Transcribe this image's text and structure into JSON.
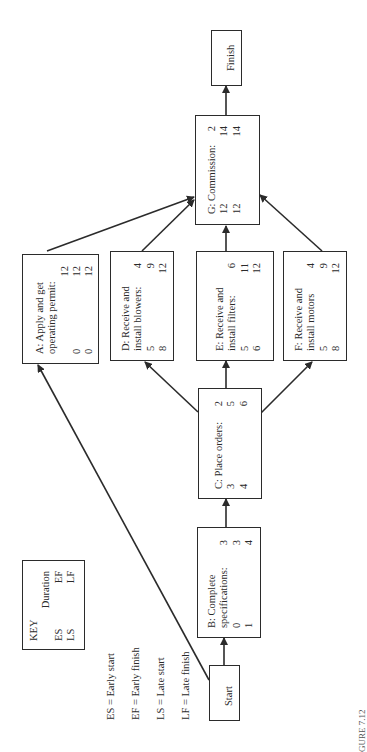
{
  "diagram": {
    "orientation": "rotated-90-ccw",
    "nodes": {
      "start": {
        "label": "Start"
      },
      "finish": {
        "label": "Finish"
      },
      "A": {
        "title_line1": "A: Apply and get",
        "title_line2": "operating permit:",
        "duration": "12",
        "es": "0",
        "ef": "12",
        "ls": "0",
        "lf": "12"
      },
      "B": {
        "title_line1": "B: Complete",
        "title_line2": "specifications:",
        "duration": "3",
        "es": "0",
        "ef": "3",
        "ls": "1",
        "lf": "4"
      },
      "C": {
        "title_line1": "C: Place orders:",
        "duration": "2",
        "es": "3",
        "ef": "5",
        "ls": "4",
        "lf": "6"
      },
      "D": {
        "title_line1": "D: Receive and",
        "title_line2": "install blowers:",
        "duration": "4",
        "es": "5",
        "ef": "9",
        "ls": "8",
        "lf": "12"
      },
      "E": {
        "title_line1": "E: Receive and",
        "title_line2": "install filters:",
        "duration": "6",
        "es": "5",
        "ef": "11",
        "ls": "6",
        "lf": "12"
      },
      "F": {
        "title_line1": "F: Receive and",
        "title_line2": "install motors",
        "duration": "4",
        "es": "5",
        "ef": "9",
        "ls": "8",
        "lf": "12"
      },
      "G": {
        "title_line1": "G: Commission:",
        "duration": "2",
        "es": "12",
        "ef": "14",
        "ls": "12",
        "lf": "14"
      }
    },
    "edges": [
      [
        "Start",
        "A"
      ],
      [
        "Start",
        "B"
      ],
      [
        "B",
        "C"
      ],
      [
        "C",
        "D"
      ],
      [
        "C",
        "E"
      ],
      [
        "C",
        "F"
      ],
      [
        "A",
        "G"
      ],
      [
        "D",
        "G"
      ],
      [
        "E",
        "G"
      ],
      [
        "F",
        "G"
      ],
      [
        "G",
        "Finish"
      ]
    ],
    "key": {
      "title": "KEY",
      "duration": "Duration",
      "es": "ES",
      "ef": "EF",
      "ls": "LS",
      "lf": "LF"
    },
    "legend": [
      "ES = Early start",
      "EF = Early finish",
      "LS = Late start",
      "LF = Late finish"
    ],
    "caption_fragment": "GURE 7.12"
  }
}
